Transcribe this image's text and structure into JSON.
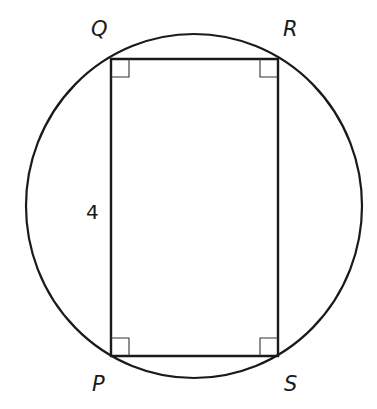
{
  "diagram": {
    "shapes": {
      "circle": {
        "cx": 194,
        "cy": 206,
        "rx": 168,
        "ry": 172
      },
      "rectangle": {
        "vertices": {
          "Q": [
            111,
            59
          ],
          "R": [
            278,
            59
          ],
          "S": [
            278,
            356
          ],
          "P": [
            111,
            356
          ]
        }
      },
      "right_angle_marker_size": 18
    },
    "labels": {
      "Q": "Q",
      "R": "R",
      "P": "P",
      "S": "S",
      "side_PQ": "4"
    },
    "colors": {
      "stroke": "#1a1a1a",
      "background": "#ffffff"
    }
  }
}
